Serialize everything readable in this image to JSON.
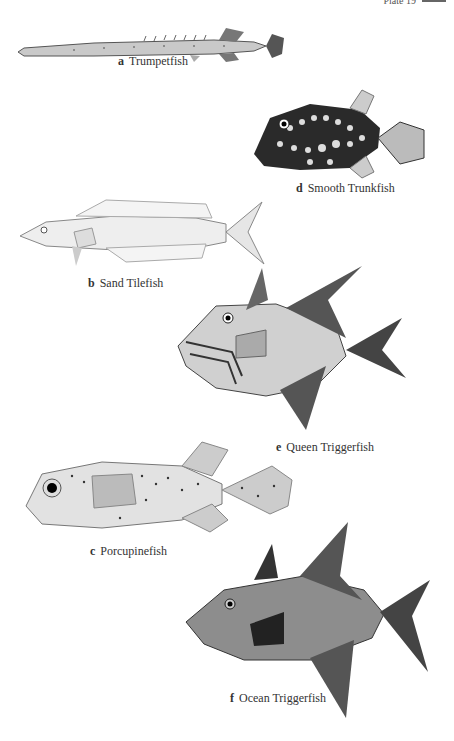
{
  "header": {
    "text": "Plate 19"
  },
  "plate": {
    "figures": [
      {
        "letter": "a",
        "name": "Trumpetfish"
      },
      {
        "letter": "b",
        "name": "Sand Tilefish"
      },
      {
        "letter": "c",
        "name": "Porcupinefish"
      },
      {
        "letter": "d",
        "name": "Smooth Trunkfish"
      },
      {
        "letter": "e",
        "name": "Queen Triggerfish"
      },
      {
        "letter": "f",
        "name": "Ocean Triggerfish"
      }
    ]
  },
  "colors": {
    "ink": "#333333",
    "paper": "#ffffff"
  }
}
